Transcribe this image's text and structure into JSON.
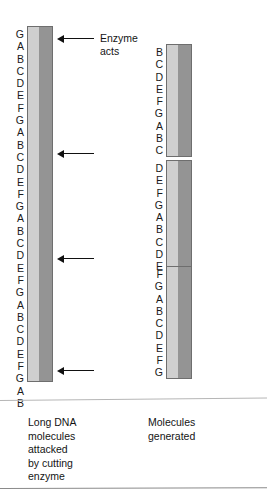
{
  "figure": {
    "title_label": "DNA restriction enzyme cutting diagram",
    "colors": {
      "strand_light": "#cfcfcf",
      "strand_dark": "#949494",
      "strand_line": "#151515",
      "bar_border": "#6e6e6e",
      "text": "#141414",
      "rule": "#b6b6b6"
    }
  },
  "long_molecule": {
    "name": "long-dna-molecule",
    "sequence": [
      "G",
      "A",
      "B",
      "C",
      "D",
      "E",
      "F",
      "G",
      "A",
      "B",
      "C",
      "D",
      "E",
      "F",
      "G",
      "A",
      "B",
      "C",
      "D",
      "E",
      "F",
      "G",
      "A",
      "B",
      "C",
      "D",
      "E",
      "F",
      "G",
      "A",
      "B"
    ],
    "letter_count": 31
  },
  "fragments": [
    {
      "name": "fragment-1",
      "sequence": [
        "B",
        "C",
        "D",
        "E",
        "F",
        "G",
        "A",
        "B",
        "C"
      ],
      "letter_count": 9
    },
    {
      "name": "fragment-2",
      "sequence": [
        "D",
        "E",
        "F",
        "G",
        "A",
        "B",
        "C",
        "D",
        "E"
      ],
      "letter_count": 9
    },
    {
      "name": "fragment-3",
      "sequence": [
        "F",
        "G",
        "A",
        "B",
        "C",
        "D",
        "E",
        "F",
        "G"
      ],
      "letter_count": 9
    }
  ],
  "annotations": {
    "enzyme_acts": {
      "name": "enzyme-acts-callout",
      "line1": "Enzyme",
      "line2": "acts"
    },
    "cut_arrows": [
      {
        "name": "cut-arrow-1"
      },
      {
        "name": "cut-arrow-2"
      },
      {
        "name": "cut-arrow-3"
      },
      {
        "name": "cut-arrow-4"
      }
    ]
  },
  "captions": {
    "left": {
      "name": "caption-left",
      "lines": [
        "Long DNA",
        "molecules",
        "attacked",
        "by cutting",
        "enzyme"
      ]
    },
    "right": {
      "name": "caption-right",
      "lines": [
        "Molecules",
        "generated"
      ]
    }
  }
}
